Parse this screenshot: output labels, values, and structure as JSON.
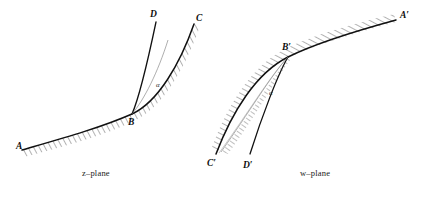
{
  "figure": {
    "type": "conformal-mapping-diagram",
    "stroke_color": "#111111",
    "hatch_color": "#444444",
    "background": "#ffffff"
  },
  "z_plane": {
    "label": "z–plane",
    "points": [
      {
        "name": "A",
        "label": "A",
        "x": 16,
        "y": 146
      },
      {
        "name": "B",
        "label": "B",
        "x": 132,
        "y": 114
      },
      {
        "name": "C",
        "label": "C",
        "x": 196,
        "y": 18
      },
      {
        "name": "D",
        "label": "D",
        "x": 155,
        "y": 14
      }
    ],
    "angle": {
      "symbol": "α",
      "x": 160,
      "y": 84
    },
    "curves": [
      {
        "name": "boundary-A-B-C",
        "hatched": true
      },
      {
        "name": "boundary-B-D",
        "hatched": false
      }
    ]
  },
  "w_plane": {
    "label": "w–plane",
    "points": [
      {
        "name": "A-prime",
        "label": "A′",
        "x": 400,
        "y": 16
      },
      {
        "name": "B-prime",
        "label": "B′",
        "x": 288,
        "y": 55
      },
      {
        "name": "C-prime",
        "label": "C′",
        "x": 211,
        "y": 158
      },
      {
        "name": "D-prime",
        "label": "D′",
        "x": 246,
        "y": 160
      }
    ],
    "angle": {
      "symbol": "α",
      "x": 272,
      "y": 92
    },
    "curves": [
      {
        "name": "boundary-A-prime-B-prime-C-prime",
        "hatched": true
      },
      {
        "name": "boundary-B-prime-D-prime",
        "hatched": false
      }
    ]
  },
  "caption": {
    "text": ""
  }
}
